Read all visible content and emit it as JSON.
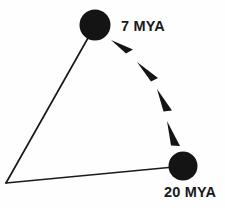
{
  "diagram": {
    "type": "node-link-diagram",
    "background_color": "#fefefe",
    "stroke_color": "#1a1a1a",
    "nodes": [
      {
        "id": "node-7mya",
        "label": "7 MYA",
        "shape": "filled-circle",
        "cx": 95,
        "cy": 25,
        "r": 15,
        "fill": "#141414"
      },
      {
        "id": "node-20mya",
        "label": "20 MYA",
        "shape": "filled-circle",
        "cx": 183,
        "cy": 166,
        "r": 14,
        "fill": "#141414"
      }
    ],
    "vertex": {
      "id": "apex-vertex",
      "x": 6,
      "y": 183
    },
    "edges": [
      {
        "id": "edge-left",
        "from": "node-7mya",
        "to": "apex-vertex",
        "style": "solid",
        "width": 1.6
      },
      {
        "id": "edge-bottom",
        "from": "apex-vertex",
        "to": "node-20mya",
        "style": "solid",
        "width": 1.6
      }
    ],
    "arrow_path": {
      "id": "migration-arc",
      "from": "node-20mya",
      "to": "node-7mya",
      "style": "dashed-arrowheads",
      "direction": "upward-left",
      "arrowhead_count": 4,
      "fill": "#141414"
    }
  }
}
